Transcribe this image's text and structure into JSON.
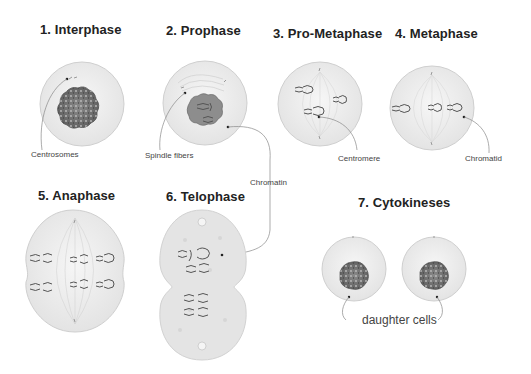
{
  "diagram": {
    "stages": [
      {
        "id": 1,
        "title": "1. Interphase",
        "label": "Centrosomes"
      },
      {
        "id": 2,
        "title": "2. Prophase",
        "label": "Spindle fibers"
      },
      {
        "id": 3,
        "title": "3. Pro-Metaphase",
        "label": "Centromere"
      },
      {
        "id": 4,
        "title": "4. Metaphase",
        "label": "Chromatid"
      },
      {
        "id": 5,
        "title": "5. Anaphase"
      },
      {
        "id": 6,
        "title": "6. Telophase"
      },
      {
        "id": 7,
        "title": "7. Cytokineses",
        "label": "daughter cells"
      }
    ],
    "shared_labels": {
      "chromatin": "Chromatin"
    },
    "colors": {
      "cell_fill": "#ececec",
      "cell_stroke": "#c8c8c8",
      "nucleus_fill": "#7a7a7a",
      "chromosome": "#555555",
      "leader_line": "#777777",
      "title_text": "#222222",
      "label_text": "#444444"
    }
  }
}
